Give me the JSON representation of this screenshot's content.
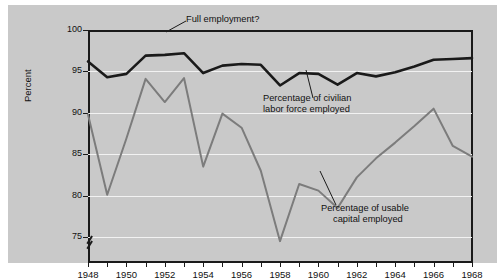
{
  "chart_data": {
    "type": "line",
    "title": "",
    "xlabel": "",
    "ylabel": "Percent",
    "xlim": [
      1948,
      1968
    ],
    "ylim": [
      72,
      100
    ],
    "ytick_values": [
      75,
      80,
      85,
      90,
      95,
      100
    ],
    "ytick_labels": [
      "75",
      "80",
      "85",
      "90",
      "95",
      "100"
    ],
    "xtick_values": [
      1948,
      1949,
      1950,
      1951,
      1952,
      1953,
      1954,
      1955,
      1956,
      1957,
      1958,
      1959,
      1960,
      1961,
      1962,
      1963,
      1964,
      1965,
      1966,
      1967,
      1968
    ],
    "xtick_labels": [
      "1948",
      "",
      "1950",
      "",
      "1952",
      "",
      "1954",
      "",
      "1956",
      "",
      "1958",
      "",
      "1960",
      "",
      "1962",
      "",
      "1964",
      "",
      "1966",
      "",
      "1968"
    ],
    "axis_break": true,
    "axis_break_note": "y-axis broken below 75",
    "grid": "horizontal",
    "legend": "annotations",
    "x": [
      1948,
      1949,
      1950,
      1951,
      1952,
      1953,
      1954,
      1955,
      1956,
      1957,
      1958,
      1959,
      1960,
      1961,
      1962,
      1963,
      1964,
      1965,
      1966,
      1967,
      1968
    ],
    "series": [
      {
        "name": "Percentage of civilian labor force employed",
        "color": "#1a1a1a",
        "width": 2.6,
        "values": [
          96.2,
          94.3,
          94.7,
          96.9,
          97.0,
          97.2,
          94.8,
          95.7,
          95.9,
          95.8,
          93.3,
          94.8,
          94.7,
          93.4,
          94.8,
          94.4,
          94.9,
          95.6,
          96.4,
          96.5,
          96.6
        ]
      },
      {
        "name": "Percentage of usable capital employed",
        "color": "#7c7c7c",
        "width": 2.0,
        "values": [
          89.8,
          80.1,
          86.9,
          94.1,
          91.3,
          94.2,
          83.5,
          89.9,
          88.2,
          83.0,
          74.5,
          81.4,
          80.6,
          78.5,
          82.2,
          84.5,
          86.4,
          88.4,
          90.5,
          86.0,
          84.7
        ]
      }
    ],
    "annotations": [
      {
        "name": "full-employment",
        "text": "Full employment?",
        "x": 1955.0,
        "y_label": 100
      },
      {
        "name": "civilian-labor",
        "line1": "Percentage of civilian",
        "line2": "labor force employed",
        "points_to_year": 1959
      },
      {
        "name": "usable-capital",
        "line1": "Percentage of usable",
        "line2": "capital employed",
        "points_to_year": 1961
      }
    ]
  },
  "axis": {
    "ylabel": "Percent"
  },
  "annotations": {
    "full_employment": "Full employment?",
    "civilian_line1": "Percentage of civilian",
    "civilian_line2": "labor force employed",
    "capital_line1": "Percentage of usable",
    "capital_line2": "capital employed"
  },
  "colors": {
    "background": "#c9c9c9",
    "page": "#ffffff",
    "axis": "#1a1a1a",
    "grid": "#f2f2f2",
    "series_black": "#1a1a1a",
    "series_gray": "#7c7c7c"
  }
}
